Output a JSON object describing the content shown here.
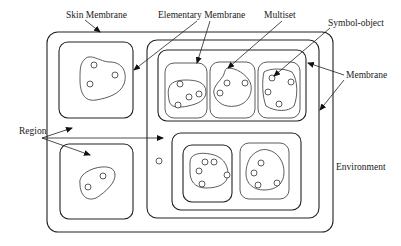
{
  "diagram": {
    "title": "",
    "labels": {
      "skin_membrane": "Skin Membrane",
      "elementary_membrane": "Elementary Membrane",
      "multiset": "Multiset",
      "symbol_object": "Symbol-object",
      "membrane": "Membrane",
      "region": "Region",
      "environment": "Environment"
    },
    "colors": {
      "stroke": "#222222",
      "background": "#ffffff"
    },
    "structure": {
      "skin": "outer rounded rectangle containing all membranes",
      "top_left_region": {
        "objects": 3
      },
      "bottom_left_region": {
        "objects": 2
      },
      "free_object_in_skin": 1,
      "right_membrane": {
        "top_container": {
          "elementary_membranes": [
            {
              "objects": 4
            },
            {
              "objects": 3
            },
            {
              "objects": 4
            }
          ]
        },
        "bottom_container": {
          "membranes": [
            {
              "objects": 5
            },
            {
              "objects": 4
            }
          ]
        }
      }
    }
  }
}
